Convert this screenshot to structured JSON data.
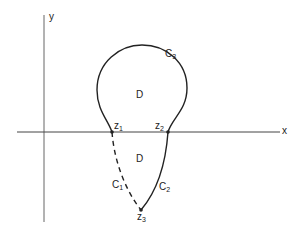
{
  "diagram": {
    "axes": {
      "x_label": "x",
      "y_label": "y"
    },
    "points": [
      {
        "name": "z",
        "sub": "1"
      },
      {
        "name": "z",
        "sub": "2"
      },
      {
        "name": "z",
        "sub": "3"
      }
    ],
    "curves": [
      {
        "name": "C",
        "sub": "1",
        "style": "dashed"
      },
      {
        "name": "C",
        "sub": "2",
        "style": "solid"
      },
      {
        "name": "C",
        "sub": "3",
        "style": "solid"
      }
    ],
    "regions": [
      {
        "label": "D"
      },
      {
        "label": "D"
      }
    ],
    "colors": {
      "stroke": "#222222",
      "axis": "#555555",
      "background": "#ffffff"
    }
  }
}
